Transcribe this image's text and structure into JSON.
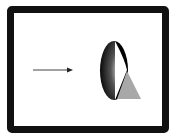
{
  "diagram": {
    "elements": [
      {
        "type": "arrow",
        "direction": "right",
        "color": "#444444"
      },
      {
        "type": "ellipse",
        "fill": "radial gradient black to white",
        "split": "left half shaded, right half white"
      },
      {
        "type": "triangle",
        "color": "#a8a8a8"
      }
    ],
    "colors": {
      "frame": "#111111",
      "background": "#ffffff",
      "cone": "#a8a8a8",
      "arrow": "#444444"
    }
  }
}
